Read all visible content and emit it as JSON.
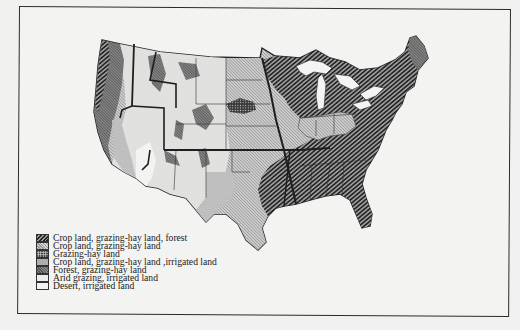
{
  "map": {
    "subject": "United States land use regions",
    "legend": [
      {
        "label": "Crop land, grazing-hay land, forest",
        "pattern": "dark-diagonal-hatch",
        "icon": "swatch-crop-grazing-forest"
      },
      {
        "label": "Crop land, grazing-hay land",
        "pattern": "light-crosshatch",
        "icon": "swatch-crop-grazing"
      },
      {
        "label": "Grazing-hay land",
        "pattern": "dark-dotted",
        "icon": "swatch-grazing-hay"
      },
      {
        "label": "Crop land, grazing-hay land ,irrigated land",
        "pattern": "medium-stipple",
        "icon": "swatch-crop-grazing-irrigated"
      },
      {
        "label": "Forest, grazing-hay land",
        "pattern": "dark-gray-fine",
        "icon": "swatch-forest-grazing"
      },
      {
        "label": "Arid grazing, irrigated land",
        "pattern": "light-stipple",
        "icon": "swatch-arid-grazing"
      },
      {
        "label": "Desert, irrigated land",
        "pattern": "plain-white",
        "icon": "swatch-desert"
      }
    ],
    "colors": {
      "ink": "#2b2b2b",
      "paper": "#f3f3f1",
      "dark_hatch": "#222222",
      "mid_gray": "#8a8a8a",
      "light_gray": "#d5d5d5"
    }
  }
}
